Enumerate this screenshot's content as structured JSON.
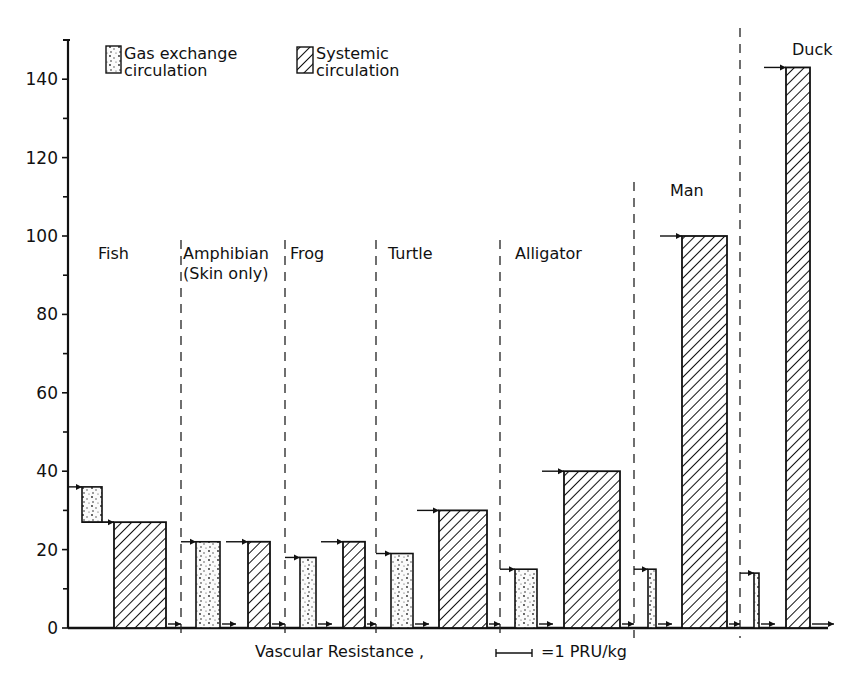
{
  "chart_data": {
    "type": "bar",
    "title": "",
    "xlabel": "Vascular Resistance",
    "scale_bar_label": "=1 PRU/kg",
    "ylabel": "",
    "ylim": [
      0,
      150
    ],
    "yticks": [
      0,
      20,
      40,
      60,
      80,
      100,
      120,
      140
    ],
    "grid": false,
    "legend": {
      "position": "top-left",
      "entries": [
        {
          "name": "Gas exchange circulation",
          "line1": "Gas exchange",
          "line2": "circulation",
          "pattern": "stipple"
        },
        {
          "name": "Systemic circulation",
          "line1": "Systemic",
          "line2": "circulation",
          "pattern": "hatch"
        }
      ]
    },
    "groups": [
      {
        "name": "Fish",
        "label_lines": [
          "Fish"
        ],
        "gas_exchange": {
          "top": 36,
          "bottom": 27
        },
        "systemic": {
          "top": 27,
          "bottom": 0
        },
        "series_arrangement": "in series"
      },
      {
        "name": "Amphibian (Skin only)",
        "label_lines": [
          "Amphibian",
          "(Skin only)"
        ],
        "gas_exchange": {
          "top": 22,
          "bottom": 0
        },
        "systemic": {
          "top": 22,
          "bottom": 0
        }
      },
      {
        "name": "Frog",
        "label_lines": [
          "Frog"
        ],
        "gas_exchange": {
          "top": 18,
          "bottom": 0
        },
        "systemic": {
          "top": 22,
          "bottom": 0
        }
      },
      {
        "name": "Turtle",
        "label_lines": [
          "Turtle"
        ],
        "gas_exchange": {
          "top": 19,
          "bottom": 0
        },
        "systemic": {
          "top": 30,
          "bottom": 0
        }
      },
      {
        "name": "Alligator",
        "label_lines": [
          "Alligator"
        ],
        "gas_exchange": {
          "top": 15,
          "bottom": 0
        },
        "systemic": {
          "top": 40,
          "bottom": 0
        }
      },
      {
        "name": "Man",
        "label_lines": [
          "Man"
        ],
        "gas_exchange": {
          "top": 15,
          "bottom": 0
        },
        "systemic": {
          "top": 100,
          "bottom": 0
        }
      },
      {
        "name": "Duck",
        "label_lines": [
          "Duck"
        ],
        "gas_exchange": {
          "top": 14,
          "bottom": 0
        },
        "systemic": {
          "top": 143,
          "bottom": 0
        }
      }
    ],
    "categories": [
      "Fish",
      "Amphibian (Skin only)",
      "Frog",
      "Turtle",
      "Alligator",
      "Man",
      "Duck"
    ],
    "series": [
      {
        "name": "Gas exchange circulation",
        "values": [
          36,
          22,
          18,
          19,
          15,
          15,
          14
        ]
      },
      {
        "name": "Systemic circulation",
        "values": [
          27,
          22,
          22,
          30,
          40,
          100,
          143
        ]
      }
    ]
  }
}
